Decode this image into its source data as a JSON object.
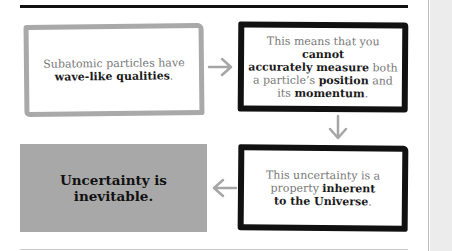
{
  "diagram": {
    "type": "flowchart",
    "nodes": [
      {
        "id": "n1",
        "style": "gray-outline",
        "segments": [
          {
            "text": "Subatomic particles have ",
            "bold": false
          },
          {
            "text": "wave-like qualities",
            "bold": true
          },
          {
            "text": ".",
            "bold": false
          }
        ]
      },
      {
        "id": "n2",
        "style": "black-outline",
        "segments": [
          {
            "text": "This means that you ",
            "bold": false
          },
          {
            "text": "cannot accurately measure",
            "bold": true
          },
          {
            "text": " both a particle’s ",
            "bold": false
          },
          {
            "text": "position",
            "bold": true
          },
          {
            "text": " and its ",
            "bold": false
          },
          {
            "text": "momentum",
            "bold": true
          },
          {
            "text": ".",
            "bold": false
          }
        ]
      },
      {
        "id": "n3",
        "style": "black-outline",
        "segments": [
          {
            "text": "This uncertainty is a property ",
            "bold": false
          },
          {
            "text": "inherent to the Universe",
            "bold": true
          },
          {
            "text": ".",
            "bold": false
          }
        ]
      },
      {
        "id": "n4",
        "style": "gray-filled",
        "segments": [
          {
            "text": "Uncertainty is inevitable.",
            "bold": true
          }
        ]
      }
    ],
    "edges": [
      {
        "from": "n1",
        "to": "n2",
        "direction": "right"
      },
      {
        "from": "n2",
        "to": "n3",
        "direction": "down"
      },
      {
        "from": "n3",
        "to": "n4",
        "direction": "left"
      }
    ],
    "colors": {
      "arrow": "#a6a6a6",
      "gray_outline": "#a9a9a9",
      "black_outline": "#111111",
      "filled_box": "#a8a8a8"
    }
  },
  "text": {
    "box1_a": "Subatomic particles have",
    "box1_b": "wave-like qualities",
    "box1_c": ".",
    "box2_a": "This means that you ",
    "box2_b": "cannot",
    "box2_c": "accurately measure",
    "box2_d": " both",
    "box2_e": "a particle’s ",
    "box2_f": "position",
    "box2_g": " and",
    "box2_h": "its ",
    "box2_i": "momentum",
    "box2_j": ".",
    "box3_a": "This uncertainty is a",
    "box3_b": "property ",
    "box3_c": "inherent",
    "box3_d": "to the Universe",
    "box3_e": ".",
    "box4_a": "Uncertainty is",
    "box4_b": "inevitable."
  }
}
